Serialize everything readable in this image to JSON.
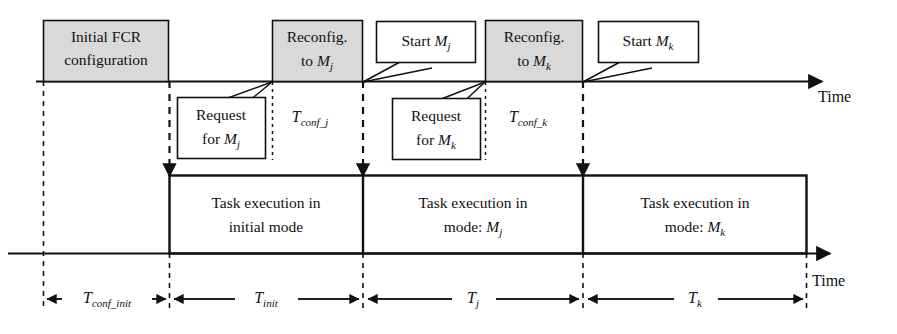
{
  "diagram": {
    "colors": {
      "shaded_fill": "#d9d9d9",
      "stroke": "#111111",
      "plain_fill": "#ffffff",
      "background": "#ffffff"
    },
    "axes": [
      {
        "id": "top-axis",
        "label": "Time"
      },
      {
        "id": "bottom-axis",
        "label": "Time"
      }
    ],
    "shaded_boxes": [
      {
        "id": "initial-fcr",
        "line1": "Initial FCR",
        "line2": "configuration"
      },
      {
        "id": "reconfig-j",
        "line1": "Reconfig.",
        "line2": "to ",
        "line2_italic": "M",
        "line2_sub": "j"
      },
      {
        "id": "reconfig-k",
        "line1": "Reconfig.",
        "line2": "to ",
        "line2_italic": "M",
        "line2_sub": "k"
      }
    ],
    "callouts": [
      {
        "id": "request-j",
        "line1": "Request",
        "line2": "for ",
        "line2_italic": "M",
        "line2_sub": "j"
      },
      {
        "id": "start-j",
        "line1": "Start ",
        "line1_italic": "M",
        "line1_sub": "j"
      },
      {
        "id": "request-k",
        "line1": "Request",
        "line2": "for ",
        "line2_italic": "M",
        "line2_sub": "k"
      },
      {
        "id": "start-k",
        "line1": "Start ",
        "line1_italic": "M",
        "line1_sub": "k"
      }
    ],
    "inline_markers": [
      {
        "id": "t-conf-j",
        "base": "T",
        "sub": "conf_j"
      },
      {
        "id": "t-conf-k",
        "base": "T",
        "sub": "conf_k"
      }
    ],
    "execution_boxes": [
      {
        "id": "exec-init",
        "line1": "Task execution in",
        "line2": "initial mode"
      },
      {
        "id": "exec-j",
        "line1": "Task execution in",
        "line2": "mode: ",
        "line2_italic": "M",
        "line2_sub": "j"
      },
      {
        "id": "exec-k",
        "line1": "Task execution in",
        "line2": "mode: ",
        "line2_italic": "M",
        "line2_sub": "k"
      }
    ],
    "durations": [
      {
        "id": "t-conf-init",
        "base": "T",
        "sub": "conf_init"
      },
      {
        "id": "t-init",
        "base": "T",
        "sub": "init"
      },
      {
        "id": "t-j",
        "base": "T",
        "sub": "j"
      },
      {
        "id": "t-k",
        "base": "T",
        "sub": "k"
      }
    ]
  }
}
